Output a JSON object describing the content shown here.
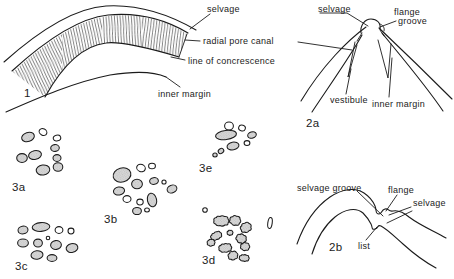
{
  "colors": {
    "ink": "#1b1b1b",
    "pore_fill": "#d8d8d8",
    "background": "#ffffff"
  },
  "fig1": {
    "number": "1",
    "selvage": "selvage",
    "radial_pore_canal": "radial pore canal",
    "line_of_concrescence": "line of concrescence",
    "inner_margin": "inner margin"
  },
  "fig2a": {
    "number": "2a",
    "selvage": "selvage",
    "flange": "flange",
    "groove": "groove",
    "vestibule": "vestibule",
    "inner_margin": "inner margin"
  },
  "fig2b": {
    "number": "2b",
    "selvage_groove": "selvage groove",
    "flange": "flange",
    "selvage": "selvage",
    "list": "list"
  },
  "fig3": {
    "a": "3a",
    "b": "3b",
    "c": "3c",
    "d": "3d",
    "e": "3e"
  }
}
